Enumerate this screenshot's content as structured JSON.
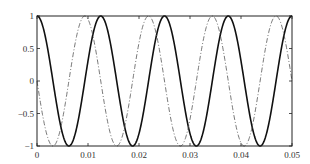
{
  "chart_data": {
    "type": "line",
    "title": "",
    "xlabel": "",
    "ylabel": "",
    "xlim": [
      0,
      0.05
    ],
    "ylim": [
      -1,
      1
    ],
    "grid": false,
    "legend": null,
    "x_ticks": [
      0,
      0.01,
      0.02,
      0.03,
      0.04,
      0.05
    ],
    "x_tick_labels": [
      "0",
      "0.01",
      "0.02",
      "0.03",
      "0.04",
      "0.05"
    ],
    "y_ticks": [
      1,
      0.5,
      0,
      -0.5,
      -1
    ],
    "y_tick_labels": [
      "1",
      "0.5",
      "0",
      "−0.5",
      "−1"
    ],
    "series": [
      {
        "name": "solid",
        "style": "solid",
        "color": "#111111",
        "function": "cos(2*pi*80*t)",
        "frequency_hz": 80,
        "amplitude": 1,
        "phase_rad": 0,
        "key_points": [
          {
            "x": 0,
            "y": 1
          },
          {
            "x": 0.00625,
            "y": -1
          },
          {
            "x": 0.0125,
            "y": 1
          },
          {
            "x": 0.01875,
            "y": -1
          },
          {
            "x": 0.025,
            "y": 1
          },
          {
            "x": 0.03125,
            "y": -1
          },
          {
            "x": 0.0375,
            "y": 1
          },
          {
            "x": 0.04375,
            "y": -1
          },
          {
            "x": 0.05,
            "y": 1
          }
        ]
      },
      {
        "name": "dash-dot",
        "style": "dashdot",
        "color": "#555555",
        "function": "-sin(2*pi*80*t)",
        "frequency_hz": 80,
        "amplitude": 1,
        "phase_rad": 1.5708,
        "key_points": [
          {
            "x": 0,
            "y": 0
          },
          {
            "x": 0.003125,
            "y": -1
          },
          {
            "x": 0.009375,
            "y": 1
          },
          {
            "x": 0.015625,
            "y": -1
          },
          {
            "x": 0.021875,
            "y": 1
          },
          {
            "x": 0.028125,
            "y": -1
          },
          {
            "x": 0.034375,
            "y": 1
          },
          {
            "x": 0.040625,
            "y": -1
          },
          {
            "x": 0.046875,
            "y": 1
          },
          {
            "x": 0.05,
            "y": 0
          }
        ]
      }
    ]
  }
}
